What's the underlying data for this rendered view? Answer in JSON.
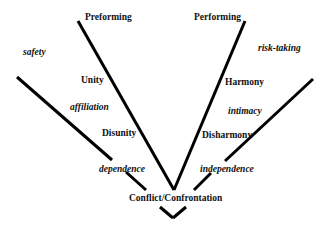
{
  "diagram": {
    "stages": {
      "preforming": "Preforming",
      "performing": "Performing",
      "unity": "Unity",
      "disunity": "Disunity",
      "harmony": "Harmony",
      "disharmony": "Disharmony",
      "conflict": "Conflict/Confrontation"
    },
    "qualities": {
      "safety": "safety",
      "affiliation": "affiliation",
      "dependence": "dependence",
      "risk_taking": "risk-taking",
      "intimacy": "intimacy",
      "independence": "independence"
    },
    "line_color": "#000000"
  }
}
